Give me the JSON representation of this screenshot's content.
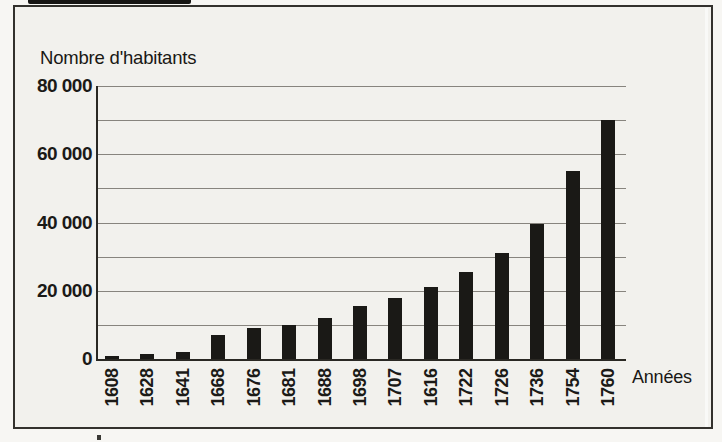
{
  "figure": {
    "title": "Nombre d'habitants",
    "x_axis_title": "Années"
  },
  "chart_data": {
    "type": "bar",
    "title": "Nombre d'habitants",
    "xlabel": "Années",
    "ylabel": "Nombre d'habitants",
    "categories": [
      "1608",
      "1628",
      "1641",
      "1668",
      "1676",
      "1681",
      "1688",
      "1698",
      "1707",
      "1616",
      "1722",
      "1726",
      "1736",
      "1754",
      "1760"
    ],
    "values": [
      800,
      1500,
      2000,
      7000,
      9000,
      10000,
      12000,
      15500,
      18000,
      21000,
      25500,
      31000,
      39500,
      55000,
      70000
    ],
    "ylim": [
      0,
      80000
    ],
    "ytick_values": [
      0,
      20000,
      40000,
      60000,
      80000
    ],
    "ytick_labels": [
      "0",
      "20 000",
      "40 000",
      "60 000",
      "80 000"
    ],
    "gridline_step": 10000,
    "grid": true,
    "legend_position": "none"
  },
  "colors": {
    "bar": "#1a1916",
    "grid": "#87847e",
    "axis": "#2a2823",
    "text": "#1b1a17",
    "paper": "#f2f1ed"
  }
}
